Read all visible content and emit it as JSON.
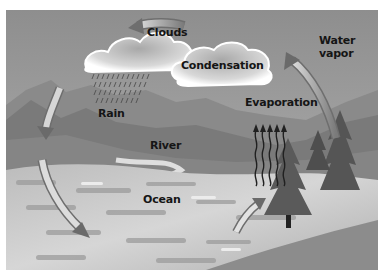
{
  "diagram": {
    "labels": {
      "clouds": "Clouds",
      "condensation": "Condensation",
      "water_vapor_line1": "Water",
      "water_vapor_line2": "vapor",
      "evaporation": "Evaporation",
      "rain": "Rain",
      "river": "River",
      "ocean": "Ocean"
    },
    "colors": {
      "sky": "#9b9b9b",
      "mountains": "#7e7e7e",
      "ocean": "#c4c4c4",
      "cloud": "#f4f4f4",
      "text": "#151515"
    }
  }
}
